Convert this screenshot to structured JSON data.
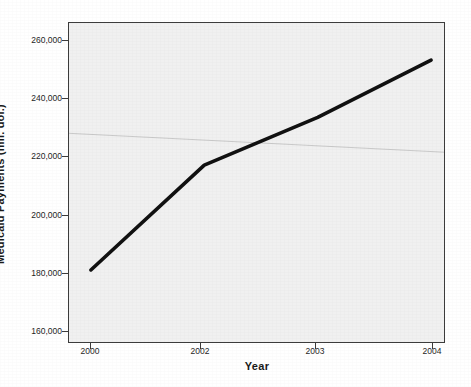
{
  "chart_data": {
    "type": "line",
    "title": "",
    "xlabel": "Year",
    "ylabel": "Medicaid Payments (mil. dol.)",
    "categories": [
      "2000",
      "2002",
      "2003",
      "2004"
    ],
    "values": [
      169000,
      214000,
      234500,
      259000
    ],
    "series": [
      {
        "name": "Medicaid Payments",
        "values": [
          169000,
          214000,
          234500,
          259000
        ]
      }
    ],
    "y_ticks": [
      "160,000",
      "180,000",
      "200,000",
      "220,000",
      "240,000",
      "260,000"
    ],
    "y_tick_values": [
      160000,
      180000,
      200000,
      220000,
      240000,
      260000
    ],
    "x_ticks": [
      "2000",
      "2002",
      "2003",
      "2004"
    ],
    "ylim": [
      156000,
      266000
    ],
    "grid": false,
    "legend": false,
    "legend_position": "none",
    "line_color": "#111111",
    "plot_background": "#f0f0f0",
    "frame_color": "#3c3c3c",
    "axis_label_color": "#1a1a1a",
    "annotations": [
      {
        "name": "scan-artifact-line",
        "description": "faint diagonal streak across plot area"
      }
    ]
  }
}
